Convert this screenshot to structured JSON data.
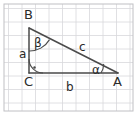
{
  "figure": {
    "width": 137,
    "height": 115,
    "background_color": "#ffffff",
    "border_color": "#c8c8c8",
    "grid": {
      "color": "#d8d8dc",
      "cell_size": 13.5,
      "visible": true
    }
  },
  "diagram": {
    "stroke_color": "#4a4a4a",
    "label_color": "#2a2a2a",
    "vertices": [
      {
        "name": "B",
        "label": "B",
        "x": 29,
        "y": 28,
        "label_x": 24,
        "label_y": 19
      },
      {
        "name": "C",
        "label": "C",
        "x": 29,
        "y": 73,
        "label_x": 24,
        "label_y": 86
      },
      {
        "name": "A",
        "label": "A",
        "x": 118,
        "y": 73,
        "label_x": 113,
        "label_y": 86
      }
    ],
    "sides": [
      {
        "name": "side-a",
        "label": "a",
        "from": "B",
        "to": "C",
        "label_x": 22,
        "label_y": 54
      },
      {
        "name": "side-b",
        "label": "b",
        "from": "C",
        "to": "A",
        "label_x": 70,
        "label_y": 87
      },
      {
        "name": "side-c",
        "label": "c",
        "from": "B",
        "to": "A",
        "label_x": 83,
        "label_y": 47
      }
    ],
    "angles": [
      {
        "name": "angle-beta",
        "label": "β",
        "at_vertex": "B",
        "label_x": 36,
        "label_y": 43,
        "marker": "arc"
      },
      {
        "name": "angle-alpha",
        "label": "α",
        "at_vertex": "A",
        "label_x": 95,
        "label_y": 70,
        "marker": "arc"
      },
      {
        "name": "angle-right",
        "label": "",
        "at_vertex": "C",
        "marker": "right-angle-dot"
      }
    ]
  }
}
